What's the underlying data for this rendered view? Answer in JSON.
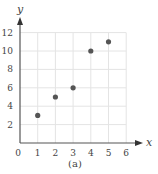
{
  "chart_data": {
    "type": "scatter",
    "title": "",
    "caption": "(a)",
    "xlabel": "x",
    "ylabel": "y",
    "xlim": [
      0,
      6
    ],
    "ylim": [
      0,
      12
    ],
    "grid": true,
    "x_ticks": [
      0,
      1,
      2,
      3,
      4,
      5,
      6
    ],
    "y_ticks": [
      2,
      4,
      6,
      8,
      10,
      12
    ],
    "series": [
      {
        "name": "points",
        "x": [
          1,
          2,
          3,
          4,
          5
        ],
        "y": [
          3,
          5,
          6,
          10,
          11
        ]
      }
    ],
    "colors": {
      "point": "#555555",
      "axis": "#555555",
      "grid": "#e4e4e4"
    }
  }
}
